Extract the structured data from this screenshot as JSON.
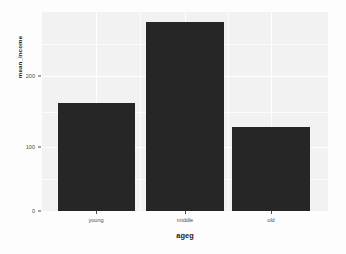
{
  "chart_data": {
    "type": "bar",
    "title": "",
    "subtitle": "",
    "xlabel": "ageg",
    "ylabel": "mean_income",
    "categories": [
      "young",
      "middle",
      "old"
    ],
    "values": [
      160,
      279,
      123
    ],
    "ylim": [
      0,
      295
    ],
    "y_ticks": [
      0,
      100,
      200
    ],
    "y_tick_labels": [
      "0",
      "100",
      "200"
    ],
    "y_minor_ticks": [
      50,
      150,
      250
    ],
    "grid": true,
    "legend": "none",
    "bar_color": "#262626",
    "panel_background": "#f2f2f2",
    "gridline_color": "#ffffff",
    "axis_text_color": "#4d4d4d",
    "axis_title_color": "#1a1a1a",
    "series": [
      {
        "name": "mean_income",
        "values": [
          160,
          279,
          123
        ]
      }
    ]
  },
  "axes": {
    "y": {
      "title": "mean_income",
      "ticks": [
        {
          "label": "200",
          "value": 200
        },
        {
          "label": "100",
          "value": 100
        },
        {
          "label": "0",
          "value": 0
        }
      ]
    },
    "x": {
      "title": "ageg",
      "ticks": [
        {
          "label": "young"
        },
        {
          "label": "middle"
        },
        {
          "label": "old"
        }
      ]
    }
  }
}
